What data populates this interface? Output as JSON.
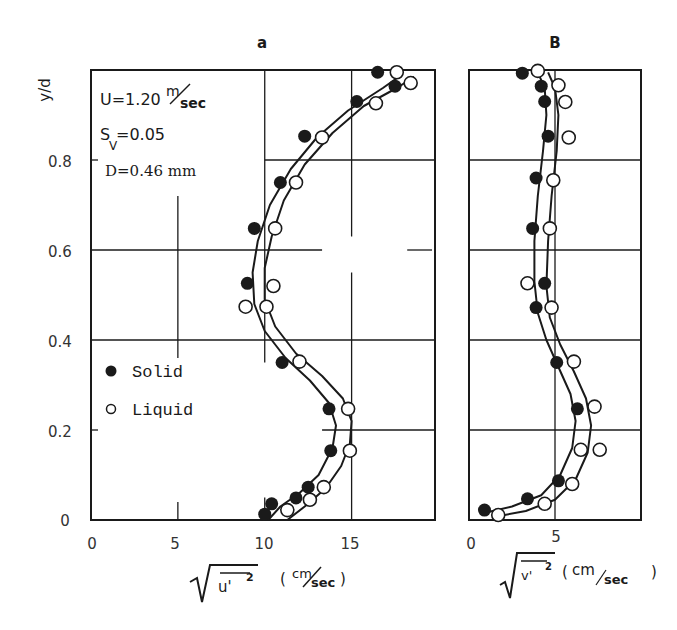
{
  "figure": {
    "ylabel": "y/d",
    "annotation": {
      "line1_prefix": "U=1.20",
      "line1_unit_num": "m",
      "line1_unit_den": "sec",
      "line2_sym": "S",
      "line2_sub": "V",
      "line2_value": "=0.05",
      "line3": "D=0.46 mm"
    },
    "legend": [
      {
        "marker": "filled-circle",
        "label": "Solid"
      },
      {
        "marker": "open-circle",
        "label": "Liquid"
      }
    ]
  },
  "chart_data": [
    {
      "type": "scatter",
      "panel_label": "a",
      "title": "a",
      "xlabel": "sqrt(u'^2) (cm/sec)",
      "xlabel_var": "u'",
      "xlabel_unit_num": "cm",
      "xlabel_unit_den": "sec",
      "ylabel": "y/d",
      "xlim": [
        0,
        19.8
      ],
      "ylim": [
        0,
        1.0
      ],
      "xticks": [
        0,
        5,
        10,
        15
      ],
      "xtick_labels": [
        "0",
        "5",
        "10",
        "15"
      ],
      "yticks": [
        0,
        0.2,
        0.4,
        0.6,
        0.8
      ],
      "ytick_labels": [
        "0",
        "0.2",
        "0.4",
        "0.6",
        "0.8"
      ],
      "grid": true,
      "legend_position": "lower-left",
      "series": [
        {
          "name": "Solid",
          "marker": "filled-circle",
          "points": [
            [
              10.0,
              0.013
            ],
            [
              10.4,
              0.036
            ],
            [
              11.8,
              0.049
            ],
            [
              12.5,
              0.073
            ],
            [
              13.8,
              0.154
            ],
            [
              13.7,
              0.247
            ],
            [
              11.0,
              0.35
            ],
            [
              9.0,
              0.526
            ],
            [
              9.4,
              0.648
            ],
            [
              10.9,
              0.75
            ],
            [
              12.3,
              0.853
            ],
            [
              15.3,
              0.93
            ],
            [
              17.5,
              0.964
            ],
            [
              16.5,
              0.995
            ]
          ],
          "curve": [
            [
              10.2,
              0.0
            ],
            [
              10.9,
              0.03
            ],
            [
              12.0,
              0.06
            ],
            [
              13.1,
              0.1
            ],
            [
              13.9,
              0.16
            ],
            [
              14.1,
              0.21
            ],
            [
              13.7,
              0.26
            ],
            [
              12.6,
              0.31
            ],
            [
              11.2,
              0.36
            ],
            [
              10.0,
              0.42
            ],
            [
              9.4,
              0.48
            ],
            [
              9.3,
              0.55
            ],
            [
              9.6,
              0.62
            ],
            [
              10.3,
              0.7
            ],
            [
              11.5,
              0.78
            ],
            [
              13.0,
              0.85
            ],
            [
              14.8,
              0.91
            ],
            [
              16.8,
              0.96
            ],
            [
              17.9,
              0.99
            ]
          ]
        },
        {
          "name": "Liquid",
          "marker": "open-circle",
          "points": [
            [
              11.3,
              0.022
            ],
            [
              12.6,
              0.045
            ],
            [
              13.4,
              0.073
            ],
            [
              14.9,
              0.154
            ],
            [
              14.8,
              0.247
            ],
            [
              12.0,
              0.352
            ],
            [
              8.9,
              0.474
            ],
            [
              10.1,
              0.474
            ],
            [
              10.5,
              0.52
            ],
            [
              10.6,
              0.648
            ],
            [
              11.8,
              0.75
            ],
            [
              13.3,
              0.85
            ],
            [
              16.4,
              0.926
            ],
            [
              18.4,
              0.971
            ],
            [
              17.6,
              0.995
            ]
          ],
          "curve": [
            [
              11.3,
              0.0
            ],
            [
              12.3,
              0.03
            ],
            [
              13.5,
              0.07
            ],
            [
              14.4,
              0.12
            ],
            [
              14.9,
              0.17
            ],
            [
              15.0,
              0.22
            ],
            [
              14.5,
              0.27
            ],
            [
              13.3,
              0.32
            ],
            [
              11.8,
              0.37
            ],
            [
              10.6,
              0.43
            ],
            [
              10.0,
              0.49
            ],
            [
              10.0,
              0.56
            ],
            [
              10.4,
              0.63
            ],
            [
              11.1,
              0.71
            ],
            [
              12.3,
              0.79
            ],
            [
              13.9,
              0.86
            ],
            [
              15.7,
              0.92
            ],
            [
              17.6,
              0.96
            ],
            [
              18.6,
              0.985
            ]
          ]
        }
      ]
    },
    {
      "type": "scatter",
      "panel_label": "B",
      "title": "B",
      "xlabel": "sqrt(v'^2) (cm/sec)",
      "xlabel_var": "v'",
      "xlabel_unit_num": "cm",
      "xlabel_unit_den": "sec",
      "ylabel": "y/d",
      "xlim": [
        0,
        10
      ],
      "ylim": [
        0,
        1.0
      ],
      "xticks": [
        0,
        5
      ],
      "xtick_labels": [
        "0",
        "5"
      ],
      "yticks": [
        0,
        0.2,
        0.4,
        0.6,
        0.8
      ],
      "grid": true,
      "series": [
        {
          "name": "Solid",
          "marker": "filled-circle",
          "points": [
            [
              0.9,
              0.022
            ],
            [
              3.4,
              0.047
            ],
            [
              5.2,
              0.087
            ],
            [
              6.3,
              0.247
            ],
            [
              5.1,
              0.35
            ],
            [
              3.9,
              0.472
            ],
            [
              4.4,
              0.526
            ],
            [
              3.7,
              0.648
            ],
            [
              3.9,
              0.76
            ],
            [
              4.6,
              0.853
            ],
            [
              4.4,
              0.93
            ],
            [
              4.2,
              0.964
            ],
            [
              3.1,
              0.993
            ]
          ],
          "curve": [
            [
              0.8,
              0.015
            ],
            [
              2.5,
              0.03
            ],
            [
              4.2,
              0.055
            ],
            [
              5.3,
              0.1
            ],
            [
              6.0,
              0.16
            ],
            [
              6.2,
              0.22
            ],
            [
              5.9,
              0.28
            ],
            [
              5.2,
              0.34
            ],
            [
              4.5,
              0.4
            ],
            [
              4.0,
              0.46
            ],
            [
              3.8,
              0.53
            ],
            [
              3.8,
              0.62
            ],
            [
              4.0,
              0.72
            ],
            [
              4.3,
              0.82
            ],
            [
              4.5,
              0.9
            ],
            [
              4.4,
              0.96
            ],
            [
              4.0,
              0.995
            ]
          ]
        },
        {
          "name": "Liquid",
          "marker": "open-circle",
          "points": [
            [
              1.7,
              0.011
            ],
            [
              4.4,
              0.036
            ],
            [
              6.0,
              0.08
            ],
            [
              6.5,
              0.156
            ],
            [
              7.6,
              0.156
            ],
            [
              7.3,
              0.252
            ],
            [
              6.1,
              0.352
            ],
            [
              4.8,
              0.472
            ],
            [
              3.4,
              0.526
            ],
            [
              4.7,
              0.648
            ],
            [
              4.9,
              0.755
            ],
            [
              5.8,
              0.85
            ],
            [
              5.6,
              0.929
            ],
            [
              5.2,
              0.966
            ],
            [
              4.0,
              0.998
            ]
          ],
          "curve": [
            [
              1.6,
              0.008
            ],
            [
              3.3,
              0.02
            ],
            [
              5.0,
              0.045
            ],
            [
              6.2,
              0.09
            ],
            [
              6.9,
              0.15
            ],
            [
              7.1,
              0.21
            ],
            [
              6.8,
              0.27
            ],
            [
              6.1,
              0.33
            ],
            [
              5.3,
              0.39
            ],
            [
              4.7,
              0.45
            ],
            [
              4.5,
              0.52
            ],
            [
              4.6,
              0.62
            ],
            [
              4.8,
              0.72
            ],
            [
              5.1,
              0.82
            ],
            [
              5.2,
              0.9
            ],
            [
              5.0,
              0.96
            ],
            [
              4.6,
              0.995
            ]
          ]
        }
      ]
    }
  ]
}
